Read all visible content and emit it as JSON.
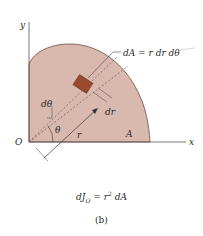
{
  "figure": {
    "panel_label": "(b)",
    "colors": {
      "region_fill": "#d9b8ad",
      "region_edge": "#6b4a42",
      "element_fill": "#9b4a32",
      "axis": "#555555",
      "dashed": "#6a5a55"
    },
    "axes": {
      "x_label": "x",
      "y_label": "y",
      "origin_label": "O"
    },
    "labels": {
      "dA_eq": "dA = r dr dθ",
      "d_theta": "dθ",
      "dr": "dr",
      "theta": "θ",
      "r": "r",
      "area": "A"
    },
    "formula": {
      "lhs_d": "dJ",
      "lhs_sub": "O",
      "eq": " = r",
      "sup": "2",
      "rhs": " dA"
    }
  }
}
